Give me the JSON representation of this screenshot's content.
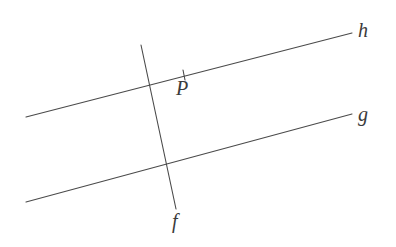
{
  "figure": {
    "kind": "geometry-diagram",
    "background_color": "#ffffff",
    "stroke_color": "#4a4a4a",
    "label_color": "#3b3b3b",
    "stroke_width": 1.1,
    "width": 396,
    "height": 247
  },
  "labels": {
    "line_h": "h",
    "line_g": "g",
    "line_f": "f",
    "point_P": "P"
  },
  "chart_data": {
    "type": "diagram",
    "title": "",
    "xlabel": "",
    "ylabel": "",
    "grid": false,
    "legend": "none",
    "xlim": [
      0,
      396
    ],
    "ylim": [
      247,
      0
    ],
    "lines": [
      {
        "name": "h",
        "label": "h",
        "x1": 26,
        "y1": 117,
        "x2": 352,
        "y2": 33,
        "label_x": 366,
        "label_y": 32
      },
      {
        "name": "g",
        "label": "g",
        "x1": 26,
        "y1": 202,
        "x2": 352,
        "y2": 114,
        "label_x": 366,
        "label_y": 116
      },
      {
        "name": "f",
        "label": "f",
        "x1": 141,
        "y1": 45,
        "x2": 176,
        "y2": 209,
        "label_x": 180,
        "label_y": 223
      }
    ],
    "ticks": [
      {
        "name": "point-P-tick",
        "on_line": "h",
        "x1": 183,
        "y1": 70,
        "x2": 185,
        "y2": 80
      }
    ],
    "points": [
      {
        "name": "P",
        "label": "P",
        "x": 184,
        "y": 75,
        "on_line": "h",
        "label_x": 186,
        "label_y": 89
      }
    ],
    "intersections": [
      {
        "lines": [
          "f",
          "h"
        ],
        "x": 148,
        "y": 84
      },
      {
        "lines": [
          "f",
          "g"
        ],
        "x": 166,
        "y": 164
      }
    ]
  }
}
